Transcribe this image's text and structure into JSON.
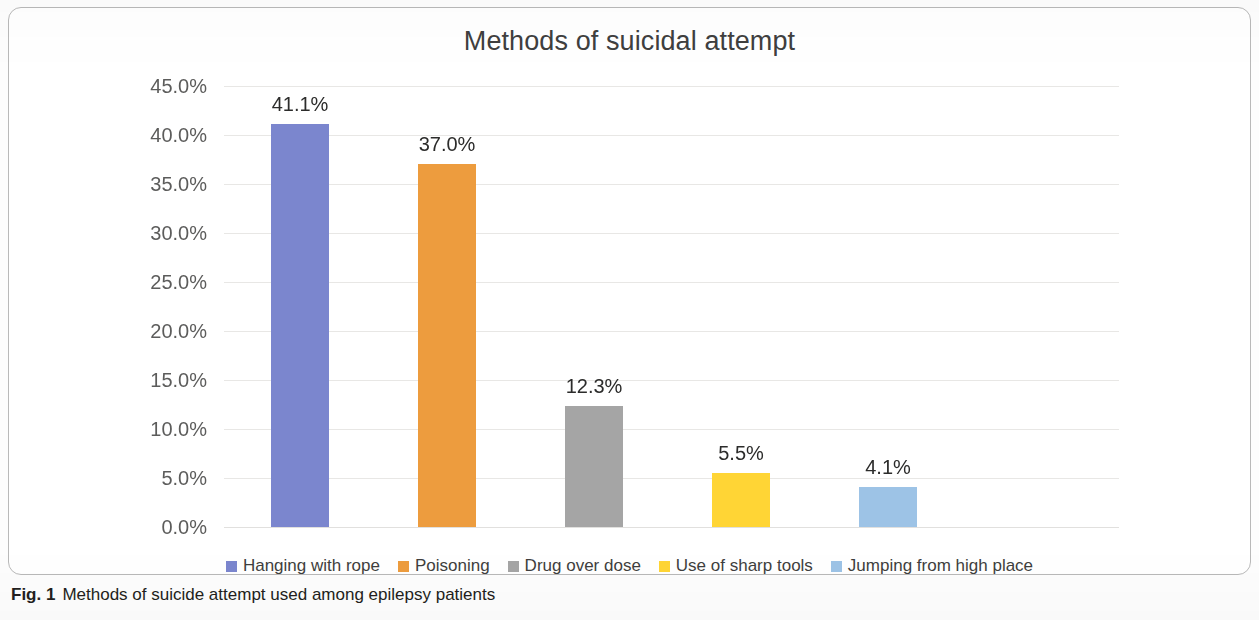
{
  "figure": {
    "fig_number": "Fig. 1",
    "caption": "Methods of suicide attempt used among epilepsy patients"
  },
  "chart_data": {
    "type": "bar",
    "title": "Methods of suicidal attempt",
    "xlabel": "",
    "ylabel": "",
    "ylim": [
      0,
      45
    ],
    "grid": true,
    "legend_position": "bottom",
    "categories": [
      "Hanging with rope",
      "Poisoning",
      "Drug over dose",
      "Use of sharp tools",
      "Jumping from high place"
    ],
    "values": [
      41.1,
      37.0,
      12.3,
      5.5,
      4.1
    ],
    "value_labels": [
      "41.1%",
      "37.0%",
      "12.3%",
      "5.5%",
      "4.1%"
    ],
    "colors": [
      "#7b86ce",
      "#ed9c3e",
      "#a5a5a5",
      "#ffd535",
      "#9dc3e6"
    ],
    "ytick_labels": [
      "45.0%",
      "40.0%",
      "35.0%",
      "30.0%",
      "25.0%",
      "20.0%",
      "15.0%",
      "10.0%",
      "5.0%",
      "0.0%"
    ],
    "ytick_values": [
      45,
      40,
      35,
      30,
      25,
      20,
      15,
      10,
      5,
      0
    ],
    "legend": [
      {
        "label": "Hanging with rope",
        "color": "#7b86ce"
      },
      {
        "label": "Poisoning",
        "color": "#ed9c3e"
      },
      {
        "label": "Drug over dose",
        "color": "#a5a5a5"
      },
      {
        "label": "Use of sharp tools",
        "color": "#ffd535"
      },
      {
        "label": "Jumping from high place",
        "color": "#9dc3e6"
      }
    ]
  }
}
